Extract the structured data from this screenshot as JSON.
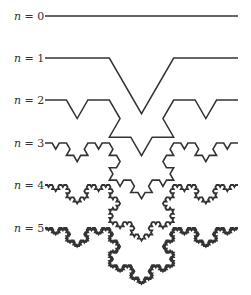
{
  "figure": {
    "variable": "n",
    "equals": " = ",
    "colors": {
      "stroke": "#333333",
      "label": "#333333",
      "background": "#ffffff"
    },
    "geometry": {
      "x_start": 45,
      "x_end": 238,
      "direction": "down"
    },
    "rows": [
      {
        "n": 0,
        "label": "0",
        "baseline_y": 16,
        "stroke_width": 1.5
      },
      {
        "n": 1,
        "label": "1",
        "baseline_y": 58,
        "stroke_width": 1.5
      },
      {
        "n": 2,
        "label": "2",
        "baseline_y": 100,
        "stroke_width": 1.5
      },
      {
        "n": 3,
        "label": "3",
        "baseline_y": 143,
        "stroke_width": 1.6
      },
      {
        "n": 4,
        "label": "4",
        "baseline_y": 185,
        "stroke_width": 1.8
      },
      {
        "n": 5,
        "label": "5",
        "baseline_y": 228,
        "stroke_width": 2.0
      }
    ]
  }
}
